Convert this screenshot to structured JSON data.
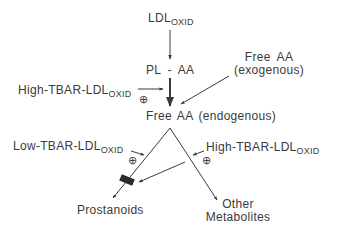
{
  "diagram": {
    "nodes": {
      "ldl_oxid": {
        "main": "LDL",
        "sub": "OXID"
      },
      "pl_aa": {
        "label": "PL - AA"
      },
      "free_aa_exo": {
        "line1": "Free AA",
        "line2": "(exogenous)"
      },
      "high_tbar_left": {
        "main": "High-TBAR-LDL",
        "sub": "OXID"
      },
      "free_aa_endo": {
        "label": "Free AA (endogenous)"
      },
      "low_tbar": {
        "main": "Low-TBAR-LDL",
        "sub": "OXID"
      },
      "high_tbar_right": {
        "main": "High-TBAR-LDL",
        "sub": "OXID"
      },
      "prostanoids": {
        "label": "Prostanoids"
      },
      "other_metabolites": {
        "line1": "Other",
        "line2": "Metabolites"
      }
    },
    "markers": {
      "plus_left": "⊕",
      "plus_low": "⊕",
      "plus_right": "⊕"
    },
    "edges": [
      {
        "from": "LDL OXID",
        "to": "PL - AA"
      },
      {
        "from": "PL - AA",
        "to": "Free AA (endogenous)",
        "style": "thick"
      },
      {
        "from": "High-TBAR-LDL OXID",
        "to": "PL-AA→Free AA step",
        "effect": "stimulates (+)"
      },
      {
        "from": "Free AA (exogenous)",
        "to": "Free AA (endogenous)"
      },
      {
        "from": "Free AA (endogenous)",
        "to": "Prostanoids"
      },
      {
        "from": "Free AA (endogenous)",
        "to": "Other Metabolites"
      },
      {
        "from": "Low-TBAR-LDL OXID",
        "to": "Prostanoids pathway",
        "effect": "stimulates (+)"
      },
      {
        "from": "High-TBAR-LDL OXID",
        "to": "Other Metabolites pathway",
        "effect": "stimulates (+)"
      },
      {
        "from": "High-TBAR-LDL OXID",
        "to": "Prostanoids pathway block",
        "effect": "inhibits"
      }
    ],
    "colors": {
      "ink": "#3a3a3a",
      "block": "#2a2a2a",
      "background": "#ffffff"
    }
  }
}
